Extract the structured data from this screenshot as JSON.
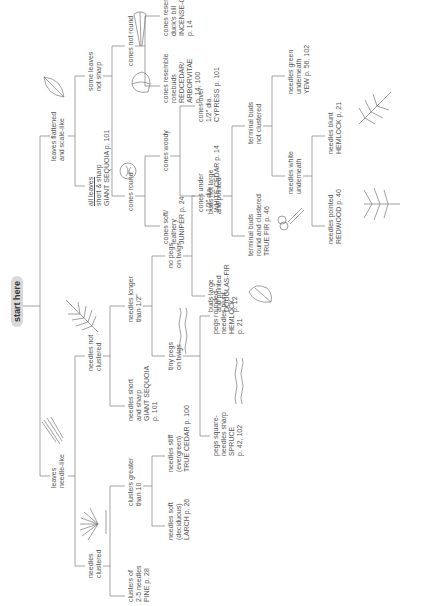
{
  "diagram": {
    "title": "start here",
    "type": "dichotomous identification key (conifers)",
    "orientation": "rotated 90 degrees counter-clockwise",
    "nodes": {
      "leaves_needle": {
        "lines": [
          "leaves",
          "needle-like"
        ]
      },
      "leaves_scale": {
        "lines": [
          "leaves flattened",
          "and scale-like"
        ]
      },
      "needles_clustered": {
        "lines": [
          "needles",
          "clustered"
        ]
      },
      "needles_not_clustered": {
        "lines": [
          "needles not",
          "clustered"
        ]
      },
      "clusters_2_5": {
        "lines": [
          "clusters of",
          "2-5 needles",
          "PINE p. 28"
        ]
      },
      "clusters_gt10": {
        "lines": [
          "clusters greater",
          "than 10"
        ]
      },
      "needles_soft": {
        "lines": [
          "needles soft",
          "(deciduous)",
          "LARCH p. 26"
        ]
      },
      "needles_stiff": {
        "lines": [
          "needles stiff",
          "(evergreen)",
          "TRUE CEDAR p. 100"
        ]
      },
      "needles_short_sharp": {
        "lines": [
          "needles short",
          "and sharp",
          "GIANT SEQUOIA",
          "p. 101"
        ]
      },
      "needles_longer": {
        "lines": [
          "needles longer",
          "than 1/2\""
        ]
      },
      "tiny_pegs": {
        "lines": [
          "tiny pegs",
          "on twigs"
        ]
      },
      "no_pegs": {
        "lines": [
          "no pegs",
          "on twigs"
        ]
      },
      "pegs_square": {
        "lines": [
          "pegs square-",
          "needles sharp",
          "SPRUCE",
          "p. 42, 102"
        ]
      },
      "pegs_rounded": {
        "lines": [
          "pegs rounded-",
          "needles blunt",
          "HEMLOCK",
          "p. 21"
        ]
      },
      "buds_large": {
        "lines": [
          "buds large",
          "and pointed",
          "DOUGLAS-FIR",
          "p. 12"
        ]
      },
      "buds_not_large": {
        "lines": [
          "buds not large",
          "and pointed"
        ]
      },
      "terminal_clustered": {
        "lines": [
          "terminal buds",
          "round and clustered",
          "TRUE FIR p. 46"
        ]
      },
      "terminal_not_clustered": {
        "lines": [
          "terminal buds",
          "not clustered"
        ]
      },
      "needles_white": {
        "lines": [
          "needles white",
          "underneath"
        ]
      },
      "needles_green": {
        "lines": [
          "needles green",
          "underneath",
          "YEW p. 56, 102"
        ]
      },
      "needles_pointed": {
        "lines": [
          "needles pointed",
          "REDWOOD p. 40"
        ]
      },
      "needles_blunt": {
        "lines": [
          "needles blunt",
          "HEMLOCK p. 21"
        ]
      },
      "all_leaves": {
        "lines": [
          "all leaves",
          "short & sharp",
          "GIANT SEQUOIA p. 101"
        ]
      },
      "some_leaves": {
        "lines": [
          "some leaves",
          "not sharp"
        ]
      },
      "cones_round": {
        "lines": [
          "cones round"
        ]
      },
      "cones_not_round": {
        "lines": [
          "cones not round"
        ]
      },
      "cones_soft": {
        "lines": [
          "cones soft/",
          "leathery",
          "JUNIPER p. 24"
        ]
      },
      "cones_woody": {
        "lines": [
          "cones woody"
        ]
      },
      "cones_under": {
        "lines": [
          "cones under",
          "1/2\" dia.",
          "WHITE-CEDAR p. 14"
        ]
      },
      "cones_over": {
        "lines": [
          "cones over",
          "1/2\" dia.",
          "CYPRESS p. 101"
        ]
      },
      "cones_rosebuds": {
        "lines": [
          "cones resemble",
          "rosebuds",
          "REDCEDAR/",
          "ARBORVITAE",
          "p. 14, 100"
        ]
      },
      "cones_duckbill": {
        "lines": [
          "cones resemble",
          "duck's bill",
          "INCENSE-CEDAR",
          "p. 14"
        ]
      }
    },
    "icons": [
      "needle-leaf-sketch",
      "needle-cluster-sketch",
      "scale-leaf-sketch",
      "feathery-branch-sketch",
      "round-cone-sketch",
      "rosebud-cone-sketch",
      "duckbill-cone-sketch",
      "peg-twig-sketch",
      "bud-sketch",
      "clustered-buds-sketch",
      "hemlock-sprig-sketch",
      "redwood-sprig-sketch"
    ],
    "colors": {
      "line": "#8a8a8a",
      "text": "#555555",
      "title_bg": "#d9d9d9"
    }
  }
}
